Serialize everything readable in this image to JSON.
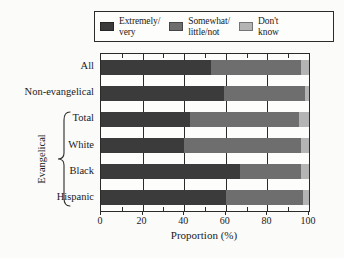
{
  "chart_data": {
    "type": "bar",
    "orientation": "horizontal",
    "stacked": true,
    "stacked_mode": "percent",
    "title": "",
    "xlabel": "Proportion (%)",
    "ylabel": "",
    "xlim": [
      0,
      100
    ],
    "xticks": [
      0,
      20,
      40,
      60,
      80,
      100
    ],
    "xticklabels": [
      "0",
      "20",
      "40",
      "60",
      "80",
      "100"
    ],
    "grid": true,
    "grid_axis": "x",
    "legend_position": "top",
    "categories": [
      "All",
      "Non-evangelical",
      "Total",
      "White",
      "Black",
      "Hispanic"
    ],
    "group_bracket": {
      "label": "Evangelical",
      "members": [
        "Total",
        "White",
        "Black",
        "Hispanic"
      ]
    },
    "series": [
      {
        "name": "Extremely/\nvery",
        "color": "#3b3b3b",
        "values": [
          53,
          59,
          43,
          40,
          67,
          60
        ]
      },
      {
        "name": "Somewhat/\nlittle/not",
        "color": "#6e6e6e",
        "values": [
          43,
          39,
          52,
          56,
          29,
          37
        ]
      },
      {
        "name": "Don't\nknow",
        "color": "#b4b4b4",
        "values": [
          4,
          2,
          5,
          4,
          4,
          3
        ]
      }
    ]
  },
  "legend": {
    "entries": [
      {
        "label": "Extremely/\nvery",
        "color": "#3b3b3b",
        "icon": "legend-swatch-dark"
      },
      {
        "label": "Somewhat/\nlittle/not",
        "color": "#6e6e6e",
        "icon": "legend-swatch-medium"
      },
      {
        "label": "Don't\nknow",
        "color": "#b4b4b4",
        "icon": "legend-swatch-light"
      }
    ]
  },
  "axis": {
    "x_title": "Proportion (%)",
    "x_ticklabels": [
      "0",
      "20",
      "40",
      "60",
      "80",
      "100"
    ],
    "y_categories": [
      "All",
      "Non-evangelical",
      "Total",
      "White",
      "Black",
      "Hispanic"
    ],
    "bracket_label": "Evangelical"
  },
  "colors": {
    "extremely_very": "#3b3b3b",
    "somewhat_little_not": "#6e6e6e",
    "dont_know": "#b4b4b4",
    "frame": "#2b2b2b",
    "background": "#fbfbfa"
  }
}
